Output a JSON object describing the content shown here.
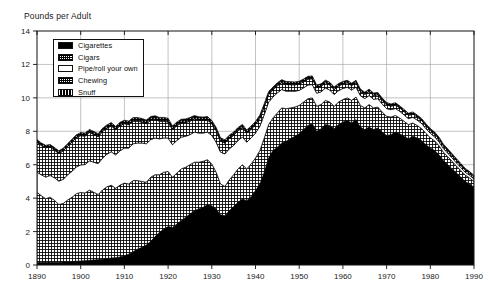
{
  "chart_data": {
    "type": "area",
    "title": "",
    "ylabel": "Pounds per Adult",
    "xlabel": "",
    "stacked": true,
    "grid": true,
    "legend_position": "top-left",
    "xlim": [
      1890,
      1990
    ],
    "ylim": [
      0,
      14
    ],
    "yticks": [
      0,
      2,
      4,
      6,
      8,
      10,
      12,
      14
    ],
    "xticks": [
      1890,
      1900,
      1910,
      1920,
      1930,
      1940,
      1950,
      1960,
      1970,
      1980,
      1990
    ],
    "x": [
      1890,
      1891,
      1892,
      1893,
      1894,
      1895,
      1896,
      1897,
      1898,
      1899,
      1900,
      1901,
      1902,
      1903,
      1904,
      1905,
      1906,
      1907,
      1908,
      1909,
      1910,
      1911,
      1912,
      1913,
      1914,
      1915,
      1916,
      1917,
      1918,
      1919,
      1920,
      1921,
      1922,
      1923,
      1924,
      1925,
      1926,
      1927,
      1928,
      1929,
      1930,
      1931,
      1932,
      1933,
      1934,
      1935,
      1936,
      1937,
      1938,
      1939,
      1940,
      1941,
      1942,
      1943,
      1944,
      1945,
      1946,
      1947,
      1948,
      1949,
      1950,
      1951,
      1952,
      1953,
      1954,
      1955,
      1956,
      1957,
      1958,
      1959,
      1960,
      1961,
      1962,
      1963,
      1964,
      1965,
      1966,
      1967,
      1968,
      1969,
      1970,
      1971,
      1972,
      1973,
      1974,
      1975,
      1976,
      1977,
      1978,
      1979,
      1980,
      1981,
      1982,
      1983,
      1984,
      1985,
      1986,
      1987,
      1988,
      1989,
      1990
    ],
    "series": [
      {
        "name": "Cigarettes",
        "pattern": "solid-black",
        "values": [
          0.15,
          0.15,
          0.16,
          0.16,
          0.17,
          0.17,
          0.18,
          0.19,
          0.2,
          0.22,
          0.24,
          0.26,
          0.28,
          0.3,
          0.32,
          0.34,
          0.38,
          0.42,
          0.44,
          0.48,
          0.55,
          0.65,
          0.8,
          0.95,
          1.05,
          1.2,
          1.4,
          1.7,
          1.95,
          2.15,
          2.3,
          2.25,
          2.45,
          2.65,
          2.85,
          3.05,
          3.25,
          3.35,
          3.45,
          3.6,
          3.55,
          3.35,
          3.0,
          2.95,
          3.25,
          3.5,
          3.75,
          3.95,
          3.85,
          4.1,
          4.45,
          4.85,
          5.55,
          6.4,
          6.85,
          7.05,
          7.3,
          7.4,
          7.55,
          7.7,
          7.85,
          8.1,
          8.35,
          8.45,
          8.0,
          8.15,
          8.4,
          8.35,
          8.15,
          8.4,
          8.55,
          8.65,
          8.5,
          8.7,
          8.25,
          8.1,
          8.25,
          8.1,
          8.2,
          7.95,
          7.75,
          7.8,
          7.95,
          7.85,
          7.7,
          7.55,
          7.7,
          7.6,
          7.45,
          7.2,
          7.0,
          6.85,
          6.6,
          6.25,
          6.0,
          5.75,
          5.5,
          5.25,
          5.0,
          4.85,
          4.65
        ]
      },
      {
        "name": "Cigars",
        "pattern": "cross-hatch",
        "values": [
          4.2,
          4.0,
          3.8,
          3.9,
          3.7,
          3.45,
          3.5,
          3.7,
          3.85,
          4.05,
          4.1,
          4.05,
          4.2,
          4.05,
          3.9,
          4.15,
          4.3,
          4.35,
          4.15,
          4.3,
          4.35,
          4.2,
          4.25,
          4.1,
          3.95,
          3.75,
          3.85,
          3.7,
          3.45,
          3.4,
          3.3,
          3.0,
          3.05,
          3.1,
          3.0,
          2.95,
          2.9,
          2.8,
          2.75,
          2.7,
          2.5,
          2.2,
          1.85,
          1.75,
          1.85,
          1.9,
          2.0,
          2.05,
          1.9,
          1.95,
          1.95,
          2.0,
          2.05,
          2.0,
          1.95,
          2.05,
          2.1,
          1.95,
          1.85,
          1.75,
          1.7,
          1.65,
          1.6,
          1.55,
          1.5,
          1.45,
          1.45,
          1.4,
          1.35,
          1.35,
          1.35,
          1.35,
          1.35,
          1.35,
          1.3,
          1.3,
          1.35,
          1.3,
          1.25,
          1.2,
          1.15,
          1.05,
          1.0,
          0.95,
          0.9,
          0.85,
          0.8,
          0.75,
          0.72,
          0.68,
          0.62,
          0.58,
          0.54,
          0.5,
          0.48,
          0.45,
          0.42,
          0.4,
          0.38,
          0.36,
          0.34
        ]
      },
      {
        "name": "Pipe/roll your own",
        "pattern": "white",
        "values": [
          1.2,
          1.25,
          1.3,
          1.3,
          1.35,
          1.4,
          1.45,
          1.5,
          1.55,
          1.6,
          1.65,
          1.7,
          1.75,
          1.8,
          1.85,
          1.9,
          1.95,
          2.0,
          2.0,
          2.05,
          2.1,
          2.15,
          2.2,
          2.25,
          2.3,
          2.3,
          2.25,
          2.2,
          2.15,
          2.05,
          2.0,
          1.95,
          1.95,
          1.9,
          1.85,
          1.8,
          1.8,
          1.75,
          1.7,
          1.65,
          1.7,
          1.8,
          1.9,
          1.95,
          1.85,
          1.75,
          1.7,
          1.65,
          1.6,
          1.55,
          1.5,
          1.45,
          1.4,
          1.35,
          1.25,
          1.2,
          1.1,
          1.05,
          1.0,
          0.95,
          0.9,
          0.85,
          0.82,
          0.8,
          0.78,
          0.76,
          0.74,
          0.72,
          0.7,
          0.68,
          0.66,
          0.64,
          0.62,
          0.6,
          0.58,
          0.56,
          0.54,
          0.52,
          0.5,
          0.48,
          0.46,
          0.44,
          0.42,
          0.4,
          0.38,
          0.36,
          0.34,
          0.32,
          0.3,
          0.28,
          0.26,
          0.24,
          0.23,
          0.22,
          0.21,
          0.2,
          0.19,
          0.18,
          0.17,
          0.16,
          0.15
        ]
      },
      {
        "name": "Chewing",
        "pattern": "dotted",
        "values": [
          1.8,
          1.75,
          1.75,
          1.7,
          1.65,
          1.65,
          1.7,
          1.7,
          1.75,
          1.75,
          1.75,
          1.7,
          1.7,
          1.65,
          1.6,
          1.6,
          1.55,
          1.55,
          1.5,
          1.5,
          1.45,
          1.4,
          1.35,
          1.3,
          1.25,
          1.2,
          1.15,
          1.1,
          1.05,
          1.0,
          0.95,
          0.9,
          0.88,
          0.85,
          0.82,
          0.8,
          0.78,
          0.76,
          0.74,
          0.72,
          0.7,
          0.68,
          0.66,
          0.64,
          0.62,
          0.6,
          0.58,
          0.56,
          0.54,
          0.52,
          0.5,
          0.48,
          0.46,
          0.44,
          0.42,
          0.42,
          0.41,
          0.4,
          0.39,
          0.38,
          0.37,
          0.36,
          0.35,
          0.34,
          0.33,
          0.32,
          0.31,
          0.3,
          0.29,
          0.28,
          0.27,
          0.26,
          0.26,
          0.25,
          0.25,
          0.24,
          0.24,
          0.23,
          0.23,
          0.22,
          0.22,
          0.21,
          0.21,
          0.2,
          0.2,
          0.19,
          0.19,
          0.18,
          0.18,
          0.17,
          0.17,
          0.16,
          0.16,
          0.15,
          0.15,
          0.14,
          0.14,
          0.13,
          0.13,
          0.12,
          0.12
        ]
      },
      {
        "name": "Snuff",
        "pattern": "dark-dotted",
        "values": [
          0.15,
          0.15,
          0.15,
          0.15,
          0.16,
          0.16,
          0.16,
          0.17,
          0.17,
          0.17,
          0.18,
          0.18,
          0.18,
          0.19,
          0.19,
          0.19,
          0.2,
          0.2,
          0.2,
          0.21,
          0.21,
          0.21,
          0.22,
          0.22,
          0.22,
          0.22,
          0.23,
          0.23,
          0.23,
          0.23,
          0.23,
          0.22,
          0.22,
          0.22,
          0.22,
          0.22,
          0.21,
          0.21,
          0.21,
          0.21,
          0.2,
          0.2,
          0.2,
          0.2,
          0.2,
          0.2,
          0.2,
          0.2,
          0.19,
          0.19,
          0.19,
          0.19,
          0.19,
          0.19,
          0.18,
          0.18,
          0.18,
          0.18,
          0.18,
          0.17,
          0.17,
          0.17,
          0.17,
          0.17,
          0.16,
          0.16,
          0.16,
          0.16,
          0.16,
          0.15,
          0.15,
          0.15,
          0.15,
          0.15,
          0.15,
          0.14,
          0.14,
          0.14,
          0.14,
          0.14,
          0.14,
          0.13,
          0.13,
          0.13,
          0.13,
          0.13,
          0.13,
          0.12,
          0.12,
          0.12,
          0.12,
          0.12,
          0.12,
          0.11,
          0.11,
          0.11,
          0.11,
          0.11,
          0.1,
          0.1,
          0.1
        ]
      }
    ]
  },
  "legend": {
    "items": [
      {
        "label": "Cigarettes"
      },
      {
        "label": "Cigars"
      },
      {
        "label": "Pipe/roll your own"
      },
      {
        "label": "Chewing"
      },
      {
        "label": "Snuff"
      }
    ]
  },
  "axis": {
    "ylabel": "Pounds per Adult"
  }
}
